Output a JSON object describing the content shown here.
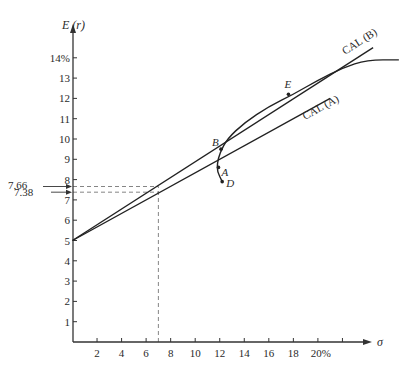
{
  "chart_data": {
    "type": "line",
    "title": "",
    "xlabel": "σ",
    "ylabel": "E (r)",
    "xlim": [
      0,
      22
    ],
    "ylim": [
      0,
      14.5
    ],
    "grid": false,
    "legend": "none",
    "x_ticks": [
      2,
      4,
      6,
      8,
      10,
      12,
      14,
      16,
      18,
      20,
      22
    ],
    "x_tick_labels": [
      "2",
      "4",
      "6",
      "8",
      "10",
      "12",
      "14",
      "16",
      "18",
      "20%",
      ""
    ],
    "y_ticks": [
      1,
      2,
      3,
      4,
      5,
      6,
      7,
      8,
      9,
      10,
      11,
      12,
      13,
      14
    ],
    "y_tick_labels": [
      "1",
      "2",
      "3",
      "4",
      "5",
      "6",
      "7",
      "8",
      "9",
      "10",
      "11",
      "12",
      "13",
      "14%"
    ],
    "series": [
      {
        "name": "CAL (B)",
        "kind": "line",
        "points": [
          [
            0,
            5
          ],
          [
            24.5,
            14.5
          ]
        ],
        "label": "CAL (B)"
      },
      {
        "name": "CAL (A)",
        "kind": "line",
        "points": [
          [
            0,
            5
          ],
          [
            21,
            12
          ]
        ],
        "label": "CAL (A)"
      },
      {
        "name": "Investment opportunity set",
        "kind": "curve",
        "points": [
          [
            12.2,
            7.9
          ],
          [
            11.8,
            8.4
          ],
          [
            11.8,
            8.8
          ],
          [
            12.0,
            9.3
          ],
          [
            12.6,
            10.0
          ],
          [
            14.0,
            10.8
          ],
          [
            16.0,
            11.6
          ],
          [
            18.0,
            12.2
          ],
          [
            20.0,
            12.9
          ],
          [
            22.0,
            13.5
          ],
          [
            24.0,
            13.9
          ],
          [
            26.6,
            13.9
          ]
        ]
      }
    ],
    "points": [
      {
        "label": "B",
        "x": 12.1,
        "y": 9.5
      },
      {
        "label": "A",
        "x": 11.9,
        "y": 8.6
      },
      {
        "label": "D",
        "x": 12.2,
        "y": 7.9
      },
      {
        "label": "E",
        "x": 17.6,
        "y": 12.2
      }
    ],
    "annotations": [
      {
        "text": "7.66",
        "y": 7.66,
        "note": "E(r) on CAL(B) at σ = 7"
      },
      {
        "text": "7.38",
        "y": 7.38,
        "note": "E(r) on CAL(A) at σ = 7"
      }
    ],
    "reference_lines": [
      {
        "kind": "vertical-dashed",
        "x": 7
      },
      {
        "kind": "horizontal-dashed",
        "y": 7.66
      },
      {
        "kind": "horizontal-dashed",
        "y": 7.38
      }
    ]
  }
}
